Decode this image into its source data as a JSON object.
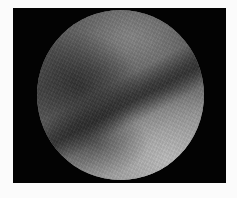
{
  "image": {
    "type": "circular-field-of-view grayscale endoscopic/microscopic image",
    "background_color": "#fbfbfb",
    "frame_color": "#030303",
    "features": [
      "darker textured tissue fold in upper-left",
      "diagonal dark crease from lower-left to upper-right",
      "brighter smooth region in lower-right"
    ]
  }
}
